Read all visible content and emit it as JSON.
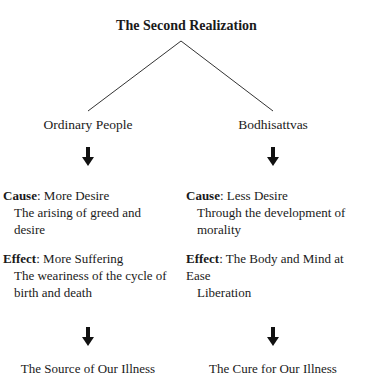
{
  "title": "The Second Realization",
  "branches": [
    {
      "heading": "Ordinary People",
      "cause": {
        "label": "Cause",
        "sep": ": ",
        "value": "More Desire",
        "detail": "The arising of greed and desire"
      },
      "effect": {
        "label": "Effect",
        "sep": ": ",
        "value": "More Suffering",
        "detail": "The weariness of the cycle of birth and death"
      },
      "outcome": "The Source of Our Illness"
    },
    {
      "heading": "Bodhisattvas",
      "cause": {
        "label": "Cause",
        "sep": ": ",
        "value": "Less Desire",
        "detail": "Through the development of morality"
      },
      "effect": {
        "label": "Effect",
        "sep": ": ",
        "value": "The Body and Mind at Ease",
        "detail": "Liberation"
      },
      "outcome": "The Cure for Our Illness"
    }
  ],
  "icons": {
    "arrow": "down-arrow-icon"
  },
  "colors": {
    "text": "#1a1a1a",
    "line": "#333333",
    "background": "#ffffff"
  }
}
